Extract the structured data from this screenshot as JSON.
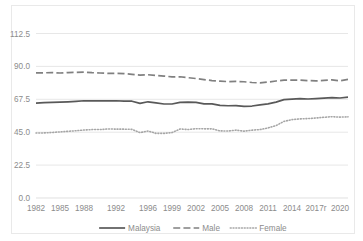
{
  "chart_data": {
    "type": "line",
    "title": "",
    "xlabel": "",
    "ylabel": "",
    "ylim": [
      0,
      112.5
    ],
    "yticks": [
      "0.0",
      "22.5",
      "45.0",
      "67.5",
      "90.0",
      "112.5"
    ],
    "ytick_values": [
      0,
      22.5,
      45,
      67.5,
      90,
      112.5
    ],
    "grid": true,
    "legend_position": "bottom",
    "x": [
      1982,
      1983,
      1984,
      1985,
      1986,
      1987,
      1988,
      1989,
      1990,
      1991,
      1992,
      1993,
      1994,
      1995,
      1996,
      1997,
      1998,
      1999,
      2000,
      2001,
      2002,
      2003,
      2004,
      2005,
      2006,
      2007,
      2008,
      2009,
      2010,
      2011,
      2012,
      2013,
      2014,
      2015,
      2016,
      2017,
      2018,
      2019,
      2020,
      2021
    ],
    "xticks": [
      "1982",
      "1985",
      "1988",
      "1992",
      "1996",
      "1999",
      "2002",
      "2005",
      "2008",
      "2011",
      "2014",
      "2017r",
      "2020"
    ],
    "xtick_values": [
      1982,
      1985,
      1988,
      1992,
      1996,
      1999,
      2002,
      2005,
      2008,
      2011,
      2014,
      2017,
      2020
    ],
    "series": [
      {
        "name": "Malaysia",
        "style": "solid",
        "color": "#595959",
        "values": [
          64.9,
          65.2,
          65.4,
          65.6,
          65.8,
          66.1,
          66.5,
          66.4,
          66.5,
          66.4,
          66.5,
          66.3,
          66.2,
          64.7,
          65.8,
          65.0,
          64.3,
          64.3,
          65.4,
          65.6,
          65.4,
          64.4,
          64.4,
          63.3,
          63.1,
          63.2,
          62.6,
          62.9,
          63.7,
          64.4,
          65.6,
          67.3,
          67.6,
          67.9,
          67.7,
          68.0,
          68.3,
          68.7,
          68.4,
          69.0
        ]
      },
      {
        "name": "Male",
        "style": "dashed",
        "color": "#808080",
        "values": [
          85.6,
          85.6,
          85.8,
          85.5,
          85.8,
          85.9,
          86.1,
          85.7,
          85.5,
          85.2,
          85.3,
          85.1,
          84.6,
          84.1,
          84.3,
          83.8,
          83.4,
          82.8,
          82.9,
          82.3,
          81.7,
          81.0,
          80.3,
          79.9,
          79.6,
          79.7,
          79.5,
          79.0,
          78.7,
          79.3,
          80.0,
          80.6,
          80.6,
          80.6,
          80.3,
          80.1,
          80.4,
          80.8,
          80.1,
          81.1
        ]
      },
      {
        "name": "Female",
        "style": "dotted",
        "color": "#a6a6a6",
        "values": [
          44.5,
          44.5,
          44.8,
          45.2,
          45.6,
          46.0,
          46.5,
          46.8,
          46.8,
          47.2,
          47.1,
          47.1,
          46.9,
          44.7,
          45.8,
          44.2,
          44.2,
          44.7,
          47.2,
          46.8,
          47.4,
          47.3,
          47.3,
          45.9,
          45.8,
          46.4,
          45.7,
          46.4,
          46.8,
          47.9,
          49.5,
          52.4,
          53.6,
          54.1,
          54.3,
          54.7,
          55.2,
          55.6,
          55.3,
          55.5
        ]
      }
    ]
  },
  "legend": {
    "items": [
      {
        "label": "Malaysia",
        "style": "solid"
      },
      {
        "label": "Male",
        "style": "dashed"
      },
      {
        "label": "Female",
        "style": "dotted"
      }
    ]
  },
  "colors": {
    "malaysia": "#595959",
    "male": "#808080",
    "female": "#a6a6a6",
    "grid": "#dcdcdc",
    "text": "#8c8c8c",
    "frame": "#e9e9e9"
  }
}
